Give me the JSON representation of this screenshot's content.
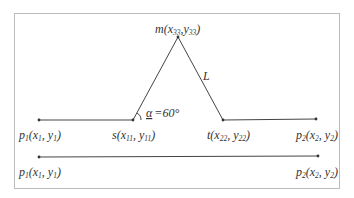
{
  "diagram": {
    "points": {
      "p1": {
        "name": "p",
        "sub": "1",
        "coords": [
          "x",
          "1",
          "y",
          "1"
        ]
      },
      "s": {
        "name": "s",
        "coords": [
          "x",
          "11",
          "y",
          "11"
        ]
      },
      "t": {
        "name": "t",
        "coords": [
          "x",
          "22",
          "y",
          "22"
        ]
      },
      "p2": {
        "name": "p",
        "sub": "2",
        "coords": [
          "x",
          "2",
          "y",
          "2"
        ]
      },
      "m": {
        "name": "m",
        "coords": [
          "x",
          "33",
          "y",
          "33"
        ]
      }
    },
    "segment_label": "L",
    "angle_label": "α =60°",
    "angle_symbol": "α",
    "angle_value": "=60°",
    "colors": {
      "line": "#444444",
      "border": "#bbbbbb",
      "text": "#333333"
    }
  }
}
